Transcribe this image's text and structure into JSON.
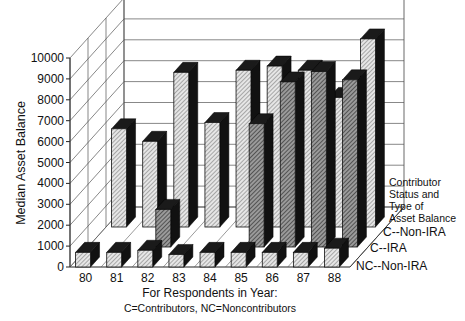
{
  "chart_data": {
    "type": "bar",
    "style": "3d-grouped-depth",
    "title": "",
    "xlabel": "For Respondents in Year:",
    "xlabel_sub": "C=Contributors, NC=Noncontributors",
    "ylabel": "Median Asset Balance",
    "ylim": [
      0,
      10000
    ],
    "yticks": [
      0,
      1000,
      2000,
      3000,
      4000,
      5000,
      6000,
      7000,
      8000,
      9000,
      10000
    ],
    "categories": [
      "80",
      "81",
      "82",
      "83",
      "84",
      "85",
      "86",
      "87",
      "88"
    ],
    "legend_title": [
      "Contributor",
      "Status and",
      "Type of",
      "Asset Balance"
    ],
    "series": [
      {
        "name": "NC--Non-IRA",
        "depth": 0,
        "values": [
          700,
          700,
          800,
          600,
          700,
          700,
          700,
          700,
          900
        ]
      },
      {
        "name": "C--IRA",
        "depth": 1,
        "values": [
          0,
          0,
          1800,
          0,
          0,
          5900,
          7900,
          8400,
          8000
        ]
      },
      {
        "name": "C--Non-IRA",
        "depth": 2,
        "values": [
          4700,
          4100,
          7400,
          5000,
          7500,
          7700,
          7500,
          6200,
          9000
        ]
      }
    ],
    "grid": true
  }
}
